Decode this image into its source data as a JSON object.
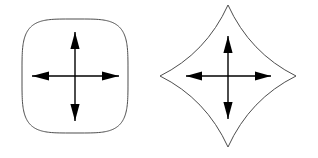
{
  "figure": {
    "width": 318,
    "height": 158,
    "background_color": "#ffffff",
    "stroke_color": "#4d4d4d",
    "arrow_color": "#000000",
    "outline_stroke_width": 1,
    "arrow_stroke_width": 1.4
  },
  "shapes": [
    {
      "id": "squircle",
      "name": "superellipse-squircle",
      "label": "",
      "description": "rounded square (superellipse) outline",
      "center": {
        "x": 75,
        "y": 76
      },
      "bounds": {
        "left": 23,
        "top": 20,
        "right": 129,
        "bottom": 133
      },
      "half_width": 53,
      "half_height": 57,
      "corner_exponent": 4.2,
      "outline_color": "#4d4d4d",
      "fill_color": "#ffffff",
      "arrow_cross": {
        "name": "four-way-arrow-cross",
        "center": {
          "x": 75,
          "y": 76
        },
        "arrows": [
          {
            "direction": "up",
            "tip": {
              "x": 75,
              "y": 32
            },
            "head_length": 17,
            "head_half_width": 4.6
          },
          {
            "direction": "down",
            "tip": {
              "x": 75,
              "y": 121
            },
            "head_length": 17,
            "head_half_width": 4.6
          },
          {
            "direction": "left",
            "tip": {
              "x": 32,
              "y": 76
            },
            "head_length": 17,
            "head_half_width": 4.6
          },
          {
            "direction": "right",
            "tip": {
              "x": 119,
              "y": 76
            },
            "head_length": 17,
            "head_half_width": 4.6
          }
        ]
      }
    },
    {
      "id": "astroid",
      "name": "astroid-four-point-star",
      "label": "",
      "description": "four-pointed star with concave (astroid) sides",
      "center": {
        "x": 228,
        "y": 76
      },
      "bounds": {
        "left": 160,
        "top": 5,
        "right": 296,
        "bottom": 147
      },
      "half_width": 68,
      "half_height": 71,
      "concavity": 0.52,
      "outline_color": "#4d4d4d",
      "fill_color": "#ffffff",
      "arrow_cross": {
        "name": "four-way-arrow-cross",
        "center": {
          "x": 228,
          "y": 76
        },
        "arrows": [
          {
            "direction": "up",
            "tip": {
              "x": 228,
              "y": 36
            },
            "head_length": 17,
            "head_half_width": 4.6
          },
          {
            "direction": "down",
            "tip": {
              "x": 228,
              "y": 119
            },
            "head_length": 17,
            "head_half_width": 4.6
          },
          {
            "direction": "left",
            "tip": {
              "x": 186,
              "y": 76
            },
            "head_length": 16,
            "head_half_width": 4.6
          },
          {
            "direction": "right",
            "tip": {
              "x": 271,
              "y": 76
            },
            "head_length": 16,
            "head_half_width": 4.6
          }
        ]
      }
    }
  ]
}
